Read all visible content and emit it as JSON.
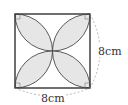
{
  "figure": {
    "shape": "square with four quarter-circle-overlap petals",
    "side_label_right": "8cm",
    "side_label_bottom": "8cm",
    "colors": {
      "stroke": "#333333",
      "petal_fill": "#e6e6e6",
      "dashed": "#999999",
      "label": "#333333"
    }
  }
}
